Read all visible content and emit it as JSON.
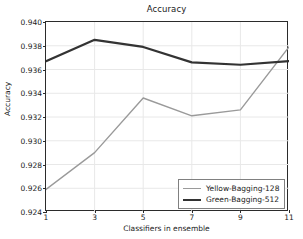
{
  "chart_data": {
    "type": "line",
    "title": "Accuracy",
    "xlabel": "Classifiers in ensemble",
    "ylabel": "Accuracy",
    "x": [
      1,
      3,
      5,
      7,
      9,
      11
    ],
    "xlim": [
      1,
      11
    ],
    "ylim": [
      0.924,
      0.94
    ],
    "xticks": [
      "1",
      "3",
      "5",
      "7",
      "9",
      "11"
    ],
    "yticks": [
      "0.924",
      "0.926",
      "0.928",
      "0.930",
      "0.932",
      "0.934",
      "0.936",
      "0.938",
      "0.940"
    ],
    "grid": true,
    "legend_position": "lower right",
    "series": [
      {
        "name": "Yellow-Bagging-128",
        "color": "#9a9a9a",
        "width": 1.4,
        "values": [
          0.9259,
          0.929,
          0.9336,
          0.9321,
          0.9326,
          0.9379
        ]
      },
      {
        "name": "Green-Bagging-512",
        "color": "#333333",
        "width": 2.2,
        "values": [
          0.9367,
          0.9385,
          0.9379,
          0.9366,
          0.9364,
          0.9367
        ]
      }
    ]
  },
  "style": {
    "axis_color": "#2b2b2b",
    "grid_color": "#e8e8e8",
    "background": "#ffffff",
    "text_color": "#1a1a1a"
  }
}
